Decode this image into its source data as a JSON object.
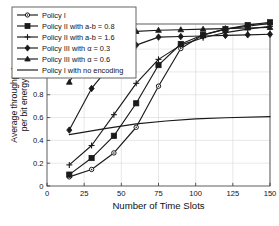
{
  "chart_data": {
    "type": "line",
    "title": "",
    "xlabel": "Number of Time Slots",
    "ylabel": "Average throughput\nper bit energy",
    "ylabel_line1": "Average throughput",
    "ylabel_line2": "per bit energy",
    "xlim": [
      0,
      150
    ],
    "ylim": [
      0,
      1.42
    ],
    "xticks": [
      0,
      25,
      50,
      75,
      100,
      125,
      150
    ],
    "xtick_labels": [
      "0",
      "25",
      "50",
      "75",
      "100",
      "125",
      "150"
    ],
    "yticks": [
      0,
      0.2,
      0.4,
      0.6,
      0.8,
      1,
      1.2
    ],
    "ytick_labels": [
      "0",
      "0.2",
      "0.4",
      "0.6",
      "0.8",
      "1",
      "1.2"
    ],
    "grid": true,
    "legend_position": "upper-left-outside",
    "series": [
      {
        "name": "Policy I",
        "marker": "circle",
        "x": [
          15,
          30,
          45,
          60,
          75,
          90,
          105,
          120,
          135,
          150
        ],
        "values": [
          0.08,
          0.145,
          0.29,
          0.515,
          0.875,
          1.205,
          1.325,
          1.375,
          1.4,
          1.425
        ]
      },
      {
        "name": "Policy II with a-b = 0.8",
        "marker": "square",
        "x": [
          15,
          30,
          45,
          60,
          75,
          90,
          105,
          120,
          135,
          150
        ],
        "values": [
          0.1,
          0.245,
          0.44,
          0.725,
          1.06,
          1.245,
          1.325,
          1.375,
          1.41,
          1.435
        ]
      },
      {
        "name": "Policy II with a-b = 1.6",
        "marker": "plus",
        "x": [
          15,
          30,
          45,
          60,
          75,
          90,
          105,
          120,
          135,
          150
        ],
        "values": [
          0.185,
          0.355,
          0.625,
          0.9,
          1.11,
          1.235,
          1.3,
          1.345,
          1.375,
          1.4
        ]
      },
      {
        "name": "Policy III with α = 0.3",
        "marker": "diamond",
        "x": [
          15,
          30,
          45,
          60,
          75,
          90,
          105,
          120,
          135,
          150
        ],
        "values": [
          0.49,
          0.855,
          1.095,
          1.235,
          1.305,
          1.31,
          1.315,
          1.32,
          1.325,
          1.33
        ]
      },
      {
        "name": "Policy III with α = 0.6",
        "marker": "triangle",
        "x": [
          15,
          30,
          45,
          60,
          75,
          90,
          105,
          120,
          135,
          150
        ],
        "values": [
          0.91,
          1.255,
          1.325,
          1.355,
          1.365,
          1.37,
          1.375,
          1.38,
          1.385,
          1.39
        ]
      },
      {
        "name": "Policy I with no encoding",
        "marker": "none",
        "x": [
          15,
          40,
          60,
          80,
          100,
          120,
          150
        ],
        "values": [
          0.45,
          0.505,
          0.545,
          0.57,
          0.588,
          0.598,
          0.608
        ]
      }
    ],
    "legend_entries": [
      "Policy I",
      "Policy II with a-b = 0.8",
      "Policy II with a-b = 1.6",
      "Policy III with α = 0.3",
      "Policy III with α = 0.6",
      "Policy I with no encoding"
    ],
    "colors": {
      "line": "#1a1a1a",
      "grid": "#d9d9d9",
      "axis": "#4d4d4d",
      "background": "#ffffff"
    }
  }
}
